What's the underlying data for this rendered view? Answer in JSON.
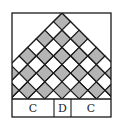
{
  "figure": {
    "type": "checkered-pyramid-diagram",
    "colors": {
      "background": "#ffffff",
      "line": "#1a1a1a",
      "shaded_cell": "#b4b4b4",
      "unshaded_cell": "#ffffff"
    },
    "frame": {
      "x": 12,
      "y": 13,
      "width": 99,
      "height": 104
    },
    "pyramid": {
      "apex": [
        62,
        13
      ],
      "baseline_y": 99,
      "cell_half_diagonal": 8.6,
      "rows": 9,
      "shading": "alternating rows, top cell shaded"
    },
    "labels": [
      {
        "text": "C",
        "x0": 12,
        "x1": 54
      },
      {
        "text": "D",
        "x0": 54,
        "x1": 71
      },
      {
        "text": "C",
        "x0": 71,
        "x1": 111
      }
    ]
  }
}
